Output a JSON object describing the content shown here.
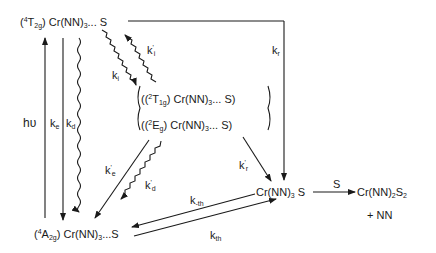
{
  "species": {
    "excited_quartet": {
      "prefix": "(",
      "sup": "4",
      "term": "T",
      "term_sub": "2g",
      "rest": ") Cr(NN)",
      "rest_sub": "3",
      "tail": "... S"
    },
    "doublet_t1g": {
      "prefix": "((",
      "sup": "2",
      "term": "T",
      "term_sub": "1g",
      "rest": ") Cr(NN)",
      "rest_sub": "3",
      "tail": "... S)"
    },
    "doublet_eg": {
      "prefix": "((",
      "sup": "2",
      "term": "E",
      "term_sub": "g",
      "rest": ") Cr(NN)",
      "rest_sub": "3",
      "tail": "... S)"
    },
    "ground": {
      "prefix": "(",
      "sup": "4",
      "term": "A",
      "term_sub": "2g",
      "rest": ") Cr(NN)",
      "rest_sub": "3",
      "tail": "...S"
    },
    "adduct": {
      "text": "Cr(NN)",
      "sub": "3",
      "tail": " S"
    },
    "product": {
      "text": "Cr(NN)",
      "sub": "2",
      "mid": "S",
      "sub2": "2"
    },
    "byproduct": "+ NN"
  },
  "rate_constants": {
    "hv": "hυ",
    "ke": {
      "base": "k",
      "sub": "e"
    },
    "kd": {
      "base": "k",
      "sub": "d"
    },
    "ki": {
      "base": "k",
      "sub": "i"
    },
    "ki_prime": {
      "base": "k",
      "sup": "'",
      "sub": "i"
    },
    "kr": {
      "base": "k",
      "sub": "r"
    },
    "ke_prime": {
      "base": "k",
      "sup": "'",
      "sub": "e"
    },
    "kd_prime": {
      "base": "k",
      "sup": "'",
      "sub": "d"
    },
    "kr_prime": {
      "base": "k",
      "sup": "'",
      "sub": "r"
    },
    "k_minus_th": {
      "base": "k",
      "sub": "-th"
    },
    "k_th": {
      "base": "k",
      "sub": "th"
    },
    "s_reagent": "S"
  }
}
